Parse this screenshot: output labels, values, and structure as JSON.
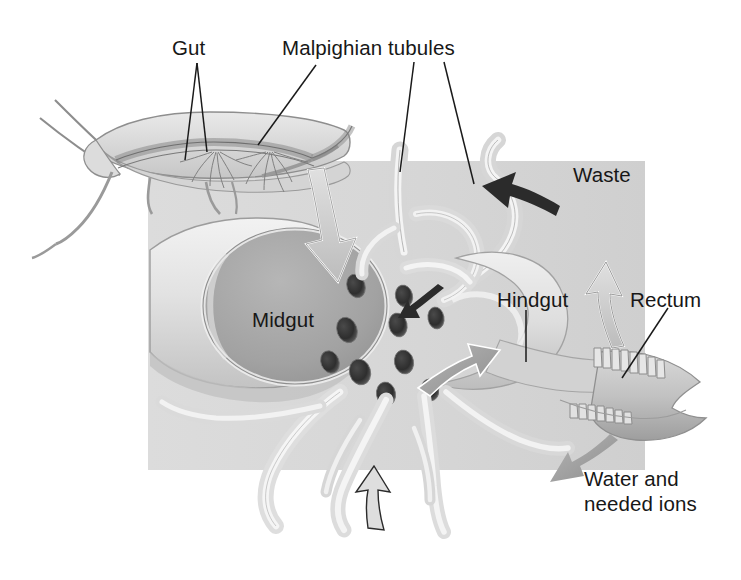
{
  "figure": {
    "background_color": "#ffffff",
    "panel_color": "#d9d9d9"
  },
  "labels": {
    "gut": "Gut",
    "malpighian_tubules": "Malpighian tubules",
    "waste": "Waste",
    "hindgut": "Hindgut",
    "rectum": "Rectum",
    "midgut": "Midgut",
    "water_line1": "Water and",
    "water_line2": "needed ions"
  },
  "structures": [
    {
      "name": "insect-body",
      "label": "Gut",
      "description": "whole grasshopper seen in lateral view with antennae and legs"
    },
    {
      "name": "midgut-tube",
      "label": "Midgut",
      "description": "cut-away cylindrical midgut with elliptical lumen opening"
    },
    {
      "name": "tubule-openings",
      "label": "",
      "count": 10,
      "description": "dark oval pores where Malpighian tubules join the gut"
    },
    {
      "name": "malpighian-tubules",
      "label": "Malpighian tubules",
      "description": "pale looping slender tubules above and below the gut"
    },
    {
      "name": "hindgut-chamber",
      "label": "Hindgut",
      "description": "large pale chamber posterior to the midgut"
    },
    {
      "name": "rectum-chamber",
      "label": "Rectum",
      "description": "terminal chamber with rectal pads"
    },
    {
      "name": "rectal-pads",
      "label": "",
      "description": "scalloped ridges lining the rectum"
    }
  ],
  "arrows": [
    {
      "name": "food-inflow-arrow",
      "label": "",
      "color": "#c9c9c9",
      "direction": "down",
      "description": "large pale arrow entering midgut lumen"
    },
    {
      "name": "waste-arrow",
      "label": "Waste",
      "color": "#2b2b2b",
      "direction": "up-left",
      "description": "dark arrow showing waste leaving via hindgut"
    },
    {
      "name": "water-reabsorption-arrow",
      "label": "",
      "color": "#bdbdbd",
      "direction": "up",
      "description": "arrow from rectal pads back into body"
    },
    {
      "name": "water-and-ions-arrow",
      "label": "Water and needed ions",
      "color": "#8f8f8f",
      "direction": "down-left",
      "description": "arrow indicating reabsorbed water and ions"
    },
    {
      "name": "tubule-secretion-arrow",
      "label": "",
      "color": "#9a9a9a",
      "direction": "up-right",
      "description": "arrow from tubules into gut lumen"
    },
    {
      "name": "tubule-uptake-arrow",
      "label": "",
      "color": "#2b2b2b",
      "direction": "up-left",
      "description": "small dark arrow at tubule pores"
    },
    {
      "name": "lower-tubule-arrow",
      "label": "",
      "color": "#2b2b2b",
      "direction": "up",
      "description": "arrow along lower tubule bundle"
    }
  ]
}
